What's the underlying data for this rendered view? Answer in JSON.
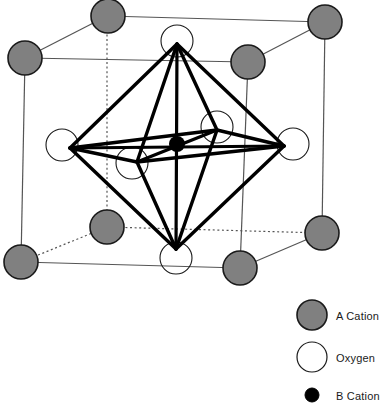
{
  "figure": {
    "name": "perovskite-unit-cell-diagram"
  },
  "colors": {
    "a_cation_fill": "#808080",
    "a_cation_stroke": "#1a1a1a",
    "oxygen_fill": "#ffffff",
    "oxygen_stroke": "#1a1a1a",
    "b_cation_fill": "#000000",
    "cube_edge": "#555555",
    "octahedron_edge": "#000000",
    "background": "#ffffff",
    "text": "#1a1a1a"
  },
  "legend": {
    "items": [
      {
        "key": "a_cation",
        "label": "A Cation",
        "marker": "filled-gray-circle",
        "cx": 312,
        "cy": 315,
        "r": 15
      },
      {
        "key": "oxygen",
        "label": "Oxygen",
        "marker": "open-circle",
        "cx": 312,
        "cy": 357,
        "r": 15
      },
      {
        "key": "b_cation",
        "label": "B Cation",
        "marker": "filled-black-circle",
        "cx": 312,
        "cy": 395,
        "r": 7
      }
    ]
  },
  "cube": {
    "vertices": {
      "front_top_left": [
        25,
        58
      ],
      "front_top_right": [
        248,
        62
      ],
      "front_bottom_left": [
        21,
        262
      ],
      "front_bottom_right": [
        240,
        268
      ],
      "back_top_left": [
        107,
        16
      ],
      "back_top_right": [
        325,
        22
      ],
      "back_bottom_left": [
        107,
        227
      ],
      "back_bottom_right": [
        322,
        233
      ]
    },
    "solid_edges": [
      [
        "front_top_left",
        "front_top_right"
      ],
      [
        "front_top_left",
        "front_bottom_left"
      ],
      [
        "front_top_right",
        "front_bottom_right"
      ],
      [
        "front_bottom_left",
        "front_bottom_right"
      ],
      [
        "front_top_left",
        "back_top_left"
      ],
      [
        "front_top_right",
        "back_top_right"
      ],
      [
        "back_top_left",
        "back_top_right"
      ],
      [
        "back_top_right",
        "back_bottom_right"
      ],
      [
        "front_bottom_right",
        "back_bottom_right"
      ]
    ],
    "dashed_edges": [
      [
        "back_top_left",
        "back_bottom_left"
      ],
      [
        "back_bottom_left",
        "back_bottom_right"
      ],
      [
        "front_bottom_left",
        "back_bottom_left"
      ]
    ]
  },
  "atoms": {
    "a_cations": [
      {
        "name": "a-cation-back-top-left",
        "cx": 108,
        "cy": 16,
        "r": 17
      },
      {
        "name": "a-cation-back-top-right",
        "cx": 325,
        "cy": 22,
        "r": 17
      },
      {
        "name": "a-cation-front-top-left",
        "cx": 25,
        "cy": 58,
        "r": 17
      },
      {
        "name": "a-cation-front-top-right",
        "cx": 248,
        "cy": 62,
        "r": 17
      },
      {
        "name": "a-cation-back-bottom-left",
        "cx": 107,
        "cy": 227,
        "r": 17
      },
      {
        "name": "a-cation-back-bottom-right",
        "cx": 322,
        "cy": 233,
        "r": 17
      },
      {
        "name": "a-cation-front-bottom-left",
        "cx": 21,
        "cy": 262,
        "r": 17
      },
      {
        "name": "a-cation-front-bottom-right",
        "cx": 240,
        "cy": 268,
        "r": 17
      }
    ],
    "oxygens": [
      {
        "name": "oxygen-top",
        "cx": 177,
        "cy": 41,
        "r": 16
      },
      {
        "name": "oxygen-bottom",
        "cx": 176,
        "cy": 258,
        "r": 16
      },
      {
        "name": "oxygen-left",
        "cx": 62,
        "cy": 145,
        "r": 16
      },
      {
        "name": "oxygen-right",
        "cx": 293,
        "cy": 144,
        "r": 16
      },
      {
        "name": "oxygen-back",
        "cx": 217,
        "cy": 127,
        "r": 16
      },
      {
        "name": "oxygen-front",
        "cx": 132,
        "cy": 163,
        "r": 16
      }
    ],
    "b_cation": {
      "name": "b-cation-center",
      "cx": 177,
      "cy": 144,
      "r": 8
    }
  },
  "octahedron": {
    "vertices": {
      "apex_top": [
        177,
        44
      ],
      "apex_bottom": [
        176,
        249
      ],
      "eq_left": [
        70,
        148
      ],
      "eq_right": [
        284,
        146
      ],
      "eq_back": [
        217,
        130
      ],
      "eq_front": [
        137,
        162
      ]
    },
    "edges": [
      [
        "apex_top",
        "eq_left"
      ],
      [
        "apex_top",
        "eq_right"
      ],
      [
        "apex_top",
        "eq_back"
      ],
      [
        "apex_top",
        "eq_front"
      ],
      [
        "apex_bottom",
        "eq_left"
      ],
      [
        "apex_bottom",
        "eq_right"
      ],
      [
        "apex_bottom",
        "eq_back"
      ],
      [
        "apex_bottom",
        "eq_front"
      ],
      [
        "eq_left",
        "eq_back"
      ],
      [
        "eq_back",
        "eq_right"
      ],
      [
        "eq_right",
        "eq_front"
      ],
      [
        "eq_front",
        "eq_left"
      ]
    ],
    "axes": [
      [
        "apex_top",
        "apex_bottom"
      ],
      [
        "eq_left",
        "eq_right"
      ],
      [
        "eq_back",
        "eq_front"
      ]
    ]
  }
}
